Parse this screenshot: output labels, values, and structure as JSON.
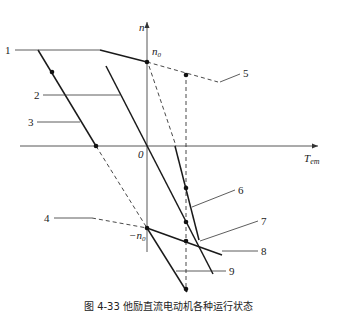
{
  "diagram": {
    "axes": {
      "y_label": "n",
      "x_label_main": "T",
      "x_label_sub": "em",
      "origin_label": "0",
      "n0_label": "n",
      "n0_sub": "0",
      "neg_n0_label": "−n",
      "neg_n0_sub": "0"
    },
    "callouts": [
      {
        "id": "1",
        "label": "1"
      },
      {
        "id": "2",
        "label": "2"
      },
      {
        "id": "3",
        "label": "3"
      },
      {
        "id": "4",
        "label": "4"
      },
      {
        "id": "5",
        "label": "5"
      },
      {
        "id": "6",
        "label": "6"
      },
      {
        "id": "7",
        "label": "7"
      },
      {
        "id": "8",
        "label": "8"
      },
      {
        "id": "9",
        "label": "9"
      }
    ],
    "colors": {
      "line": "#1a1a1a",
      "axis": "#444444",
      "background": "#ffffff"
    }
  },
  "caption": "图 4-33  他励直流电动机各种运行状态"
}
